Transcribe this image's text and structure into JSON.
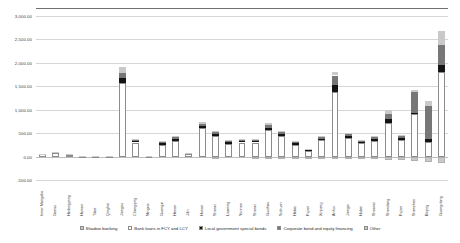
{
  "chart_data": {
    "type": "bar",
    "subtype": "stacked-bar-with-negative",
    "title": "",
    "xlabel": "",
    "ylabel": "",
    "ylim": [
      -500,
      3000
    ],
    "yticks": [
      "-500.00",
      "0.00",
      "500.00",
      "1,000.00",
      "1,500.00",
      "2,000.00",
      "2,500.00",
      "3,000.00"
    ],
    "ytick_values": [
      -500,
      0,
      500,
      1000,
      1500,
      2000,
      2500,
      3000
    ],
    "grid": true,
    "legend_position": "bottom",
    "categories": [
      "Inner Mongolia",
      "Gansu",
      "Heilongjiang",
      "Hainan",
      "Tibet",
      "Qinghai",
      "Jiangsu",
      "Chongqing",
      "Ningxia",
      "Guangxi",
      "Henan",
      "Jilin",
      "Hunan",
      "Shanxi",
      "Liaoning",
      "Yunnan",
      "Shanxi",
      "Guizhou",
      "Sichuan",
      "Hebei",
      "Fujian",
      "Xinjiang",
      "Anhui",
      "Jiangxi",
      "Hubei",
      "Shaanxi",
      "Shandong",
      "Fujian",
      "Shenzhen",
      "Beijing",
      "Guangdong"
    ],
    "series": [
      {
        "name": "Shadow banking",
        "color": "#c9c9c9",
        "values": [
          0,
          0,
          0,
          0,
          0,
          0,
          0,
          0,
          0,
          0,
          0,
          0,
          0,
          -30,
          0,
          0,
          -25,
          -22,
          -30,
          -22,
          -35,
          -40,
          -60,
          -55,
          -50,
          -55,
          -70,
          -70,
          -100,
          -120,
          -135
        ]
      },
      {
        "name": "Bank loans in FCY and LCY",
        "color": "#ffffff",
        "values": [
          45,
          80,
          40,
          12,
          10,
          8,
          1560,
          300,
          6,
          250,
          340,
          55,
          600,
          440,
          270,
          300,
          300,
          560,
          440,
          250,
          120,
          345,
          1380,
          400,
          280,
          340,
          720,
          360,
          900,
          320,
          1800
        ]
      },
      {
        "name": "Local government special bonds",
        "color": "#141414",
        "values": [
          8,
          10,
          7,
          3,
          3,
          3,
          110,
          35,
          3,
          40,
          45,
          12,
          60,
          45,
          35,
          35,
          35,
          55,
          50,
          35,
          20,
          40,
          150,
          45,
          35,
          45,
          90,
          45,
          40,
          60,
          150
        ]
      },
      {
        "name": "Corporate bond and equity financing",
        "color": "#777777",
        "values": [
          5,
          6,
          5,
          2,
          2,
          2,
          110,
          20,
          2,
          25,
          28,
          8,
          45,
          30,
          22,
          22,
          22,
          55,
          35,
          22,
          14,
          28,
          200,
          30,
          22,
          30,
          100,
          35,
          430,
          700,
          430
        ]
      },
      {
        "name": "Other",
        "color": "#c9c9c9",
        "values": [
          4,
          5,
          4,
          2,
          2,
          2,
          130,
          15,
          2,
          20,
          22,
          7,
          35,
          25,
          18,
          18,
          18,
          45,
          28,
          18,
          11,
          22,
          80,
          25,
          18,
          25,
          75,
          28,
          55,
          100,
          290
        ]
      }
    ]
  },
  "legend": {
    "items": [
      {
        "label": "Shadow banking",
        "color": "#c9c9c9"
      },
      {
        "label": "Bank loans in FCY and LCY",
        "color": "#ffffff"
      },
      {
        "label": "Local government special bonds",
        "color": "#141414"
      },
      {
        "label": "Corporate bond and equity financing",
        "color": "#777777"
      },
      {
        "label": "Other",
        "color": "#c9c9c9"
      }
    ]
  }
}
